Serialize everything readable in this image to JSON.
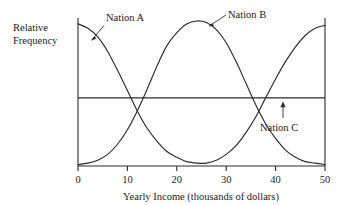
{
  "chart_data": {
    "type": "line",
    "title": "",
    "xlabel": "Yearly Income (thousands of dollars)",
    "ylabel": "Relative Frequency",
    "xlim": [
      0,
      50
    ],
    "ylim": [
      0,
      1
    ],
    "grid": false,
    "legend_position": "inline-annotations",
    "xticks": [
      0,
      10,
      20,
      30,
      40,
      50
    ],
    "xtick_labels": [
      "0",
      "10",
      "20",
      "30",
      "40",
      "50"
    ],
    "yticks": [],
    "ytick_labels": [],
    "x": [
      0,
      2,
      4,
      6,
      8,
      10,
      12,
      14,
      16,
      18,
      20,
      22,
      24,
      26,
      28,
      30,
      32,
      34,
      36,
      38,
      40,
      42,
      44,
      46,
      48,
      50
    ],
    "series": [
      {
        "name": "Nation A",
        "description": "U-shaped bimodal distribution: high at low incomes, minimum near 24, rising again toward 50",
        "values": [
          0.98,
          0.95,
          0.89,
          0.79,
          0.66,
          0.52,
          0.38,
          0.26,
          0.17,
          0.1,
          0.06,
          0.03,
          0.02,
          0.02,
          0.04,
          0.08,
          0.14,
          0.23,
          0.34,
          0.47,
          0.6,
          0.72,
          0.82,
          0.9,
          0.95,
          0.97
        ]
      },
      {
        "name": "Nation B",
        "description": "Unimodal bell-shaped distribution centered near 25",
        "values": [
          0.01,
          0.02,
          0.04,
          0.08,
          0.15,
          0.25,
          0.38,
          0.53,
          0.69,
          0.83,
          0.92,
          0.98,
          1.0,
          0.99,
          0.94,
          0.85,
          0.72,
          0.57,
          0.42,
          0.29,
          0.19,
          0.11,
          0.06,
          0.03,
          0.02,
          0.01
        ]
      },
      {
        "name": "Nation C",
        "description": "Uniform (flat) distribution across the full income range",
        "values": [
          0.47,
          0.47,
          0.47,
          0.47,
          0.47,
          0.47,
          0.47,
          0.47,
          0.47,
          0.47,
          0.47,
          0.47,
          0.47,
          0.47,
          0.47,
          0.47,
          0.47,
          0.47,
          0.47,
          0.47,
          0.47,
          0.47,
          0.47,
          0.47,
          0.47,
          0.47
        ]
      }
    ],
    "annotations": [
      {
        "text": "Nation A",
        "target_x": 5,
        "target_y": 0.73,
        "pointer": "leader-line"
      },
      {
        "text": "Nation B",
        "target_x": 24,
        "target_y": 0.99,
        "pointer": "leader-line"
      },
      {
        "text": "Nation C",
        "target_x": 45,
        "target_y": 0.47,
        "pointer": "up-arrow"
      }
    ],
    "colors": {
      "curve": "#2b2b2b",
      "axis": "#2b2b2b",
      "background": "#ffffff",
      "text": "#1a1a1a"
    }
  }
}
